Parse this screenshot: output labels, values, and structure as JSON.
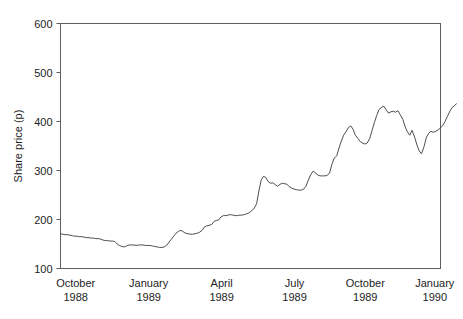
{
  "chart_data": {
    "type": "line",
    "title": "",
    "xlabel": "",
    "ylabel": "Share price (p)",
    "ylim": [
      100,
      600
    ],
    "yticks": [
      100,
      200,
      300,
      400,
      500,
      600
    ],
    "ytick_labels": [
      "100",
      "200",
      "300",
      "400",
      "500",
      "600"
    ],
    "grid": false,
    "legend": "none",
    "xlim": [
      0,
      100
    ],
    "categories": [
      "October\n1988",
      "January\n1989",
      "April\n1989",
      "July\n1989",
      "October\n1989",
      "January\n1990"
    ],
    "xtick_labels": [
      {
        "month": "October",
        "year": "1988",
        "pos": 4.0
      },
      {
        "month": "January",
        "year": "1989",
        "pos": 23.2
      },
      {
        "month": "April",
        "year": "1989",
        "pos": 42.4
      },
      {
        "month": "July",
        "year": "1989",
        "pos": 61.6
      },
      {
        "month": "October",
        "year": "1989",
        "pos": 80.2
      },
      {
        "month": "January",
        "year": "1990",
        "pos": 98.5
      }
    ],
    "series": [
      {
        "name": "Share price",
        "x": [
          0.0,
          0.6,
          1.2,
          1.9,
          2.5,
          3.1,
          3.7,
          4.3,
          5.0,
          5.6,
          6.2,
          6.8,
          7.5,
          8.1,
          8.7,
          9.3,
          9.9,
          10.6,
          11.2,
          11.8,
          12.4,
          13.0,
          13.7,
          14.3,
          14.9,
          15.5,
          16.1,
          16.8,
          17.4,
          18.0,
          18.6,
          19.3,
          19.9,
          20.5,
          21.1,
          21.7,
          22.4,
          23.0,
          23.6,
          24.2,
          24.8,
          25.5,
          26.1,
          26.7,
          27.3,
          28.0,
          28.6,
          29.2,
          29.8,
          30.4,
          31.1,
          31.7,
          32.3,
          32.9,
          33.5,
          34.2,
          34.8,
          35.4,
          36.0,
          36.6,
          37.3,
          37.9,
          38.5,
          39.1,
          39.8,
          40.4,
          41.0,
          41.6,
          42.2,
          42.9,
          43.5,
          44.1,
          44.7,
          45.3,
          46.0,
          46.6,
          47.2,
          47.8,
          48.4,
          49.1,
          49.7,
          50.3,
          50.9,
          51.6,
          52.2,
          52.8,
          53.4,
          54.0,
          54.7,
          55.3,
          55.9,
          56.5,
          57.1,
          57.8,
          58.4,
          59.0,
          59.6,
          60.2,
          60.9,
          61.5,
          62.1,
          62.7,
          63.4,
          64.0,
          64.6,
          65.2,
          65.8,
          66.5,
          67.1,
          67.7,
          68.3,
          68.9,
          69.6,
          70.2,
          70.8,
          71.4,
          72.0,
          72.7,
          73.3,
          73.9,
          74.5,
          75.2,
          75.8,
          76.4,
          77.0,
          77.6,
          78.3,
          78.9,
          79.5,
          80.1,
          80.7,
          81.4,
          82.0,
          82.6,
          83.2,
          83.8,
          84.5,
          85.1,
          85.7,
          86.3,
          87.0,
          87.6,
          88.2,
          88.8,
          89.4,
          90.1,
          90.7,
          91.3,
          91.9,
          92.5,
          93.2,
          93.8,
          94.4,
          95.0,
          95.6,
          96.3,
          96.9,
          97.5,
          98.1,
          98.8,
          99.4,
          100.0
        ],
        "values": [
          171,
          170,
          169,
          169,
          168,
          167,
          166,
          166,
          165,
          165,
          164,
          163,
          163,
          162,
          162,
          161,
          161,
          160,
          158,
          157,
          157,
          156,
          156,
          155,
          150,
          147,
          145,
          144,
          146,
          148,
          148,
          148,
          147,
          148,
          148,
          148,
          147,
          147,
          147,
          146,
          145,
          144,
          143,
          143,
          144,
          148,
          154,
          160,
          166,
          172,
          176,
          178,
          175,
          172,
          171,
          170,
          170,
          171,
          172,
          174,
          178,
          185,
          187,
          188,
          190,
          196,
          198,
          199,
          205,
          208,
          208,
          209,
          210,
          209,
          208,
          208,
          209,
          209,
          210,
          212,
          214,
          218,
          222,
          232,
          258,
          280,
          288,
          286,
          277,
          274,
          275,
          271,
          268,
          272,
          274,
          273,
          272,
          267,
          264,
          262,
          261,
          260,
          260,
          262,
          268,
          280,
          291,
          299,
          295,
          291,
          289,
          289,
          289,
          290,
          295,
          312,
          325,
          330,
          346,
          360,
          372,
          380,
          388,
          391,
          384,
          372,
          365,
          359,
          356,
          354,
          356,
          366,
          382,
          398,
          412,
          424,
          429,
          431,
          424,
          417,
          420,
          421,
          419,
          422,
          414,
          404,
          389,
          379,
          372,
          382,
          368,
          352,
          340,
          334,
          347,
          368,
          376,
          380,
          378,
          380,
          383,
          387
        ]
      },
      {
        "name": "Share price (continued)",
        "x": [
          100.0,
          100.6,
          101.2,
          101.8,
          102.4,
          103.0,
          103.6,
          104.2
        ],
        "values": [
          387,
          392,
          400,
          410,
          420,
          428,
          432,
          436
        ]
      }
    ],
    "annotations": [],
    "peak_value": 541,
    "trough_value": 143,
    "start_value": 171,
    "end_value": 499
  },
  "figure": {
    "background_color": "#ffffff",
    "line_color": "#3a3a3a",
    "frame_color": "#5f5f5f",
    "text_color": "#1d1d1d"
  }
}
